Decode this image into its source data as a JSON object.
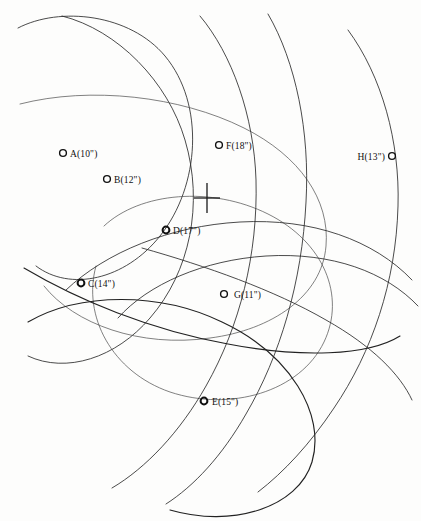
{
  "diagram": {
    "background_color": "#fdfdfc",
    "ink_color": "#2b2b2b",
    "canvas": {
      "width": 421,
      "height": 521
    },
    "crosshair": {
      "name": "center-crosshair",
      "x": 207,
      "y": 198,
      "arm_horizontal": 13,
      "arm_vertical": 15
    },
    "points": [
      {
        "id": "A",
        "label": "A(10\")",
        "radius_text": "10\"",
        "marker_x": 63,
        "marker_y": 153,
        "label_x": 70,
        "label_y": 157,
        "marker_style": "open",
        "label_side": "right"
      },
      {
        "id": "B",
        "label": "B(12\")",
        "radius_text": "12\"",
        "marker_x": 107,
        "marker_y": 179,
        "label_x": 114,
        "label_y": 183,
        "marker_style": "open",
        "label_side": "right"
      },
      {
        "id": "C",
        "label": "C(14\")",
        "radius_text": "14\"",
        "marker_x": 81,
        "marker_y": 283,
        "label_x": 88,
        "label_y": 287,
        "marker_style": "bold",
        "label_side": "right"
      },
      {
        "id": "D",
        "label": "D(17\")",
        "radius_text": "17\"",
        "marker_x": 166,
        "marker_y": 230,
        "label_x": 173,
        "label_y": 234,
        "marker_style": "bold",
        "label_side": "right"
      },
      {
        "id": "E",
        "label": "E(15\")",
        "radius_text": "15\"",
        "marker_x": 204,
        "marker_y": 401,
        "label_x": 212,
        "label_y": 405,
        "marker_style": "bold",
        "label_side": "right"
      },
      {
        "id": "F",
        "label": "F(18\")",
        "radius_text": "18\"",
        "marker_x": 219,
        "marker_y": 145,
        "label_x": 226,
        "label_y": 149,
        "marker_style": "open",
        "label_side": "right"
      },
      {
        "id": "G",
        "label": "G(11\")",
        "radius_text": "11\"",
        "marker_x": 224,
        "marker_y": 294,
        "label_x": 234,
        "label_y": 298,
        "marker_style": "open",
        "label_side": "right"
      },
      {
        "id": "H",
        "label": "H(13\")",
        "radius_text": "13\"",
        "marker_x": 392,
        "marker_y": 156,
        "label_x": 385,
        "label_y": 160,
        "marker_style": "open",
        "label_side": "left"
      }
    ],
    "arcs": [
      {
        "name": "arc-circle-1",
        "d": "M 18 28 C 60 6 130 14 165 56 C 205 104 200 186 160 236 C 125 280 70 292 36 266",
        "weight": "normal"
      },
      {
        "name": "arc-circle-2",
        "d": "M 62 16 C 118 30 168 82 185 140 C 204 204 190 272 150 318 C 116 358 66 374 28 356",
        "weight": "normal"
      },
      {
        "name": "arc-circle-3",
        "d": "M 20 104 C 90 86 180 96 244 128 C 300 156 330 200 326 246 C 322 296 272 330 210 338 C 140 348 74 324 44 286",
        "weight": "faint"
      },
      {
        "name": "arc-circle-4",
        "d": "M 104 226 C 140 192 212 186 268 214 C 324 242 346 296 324 342 C 300 392 230 412 170 392 C 112 372 82 316 96 266",
        "weight": "faint"
      },
      {
        "name": "arc-circle-5",
        "d": "M 28 322 C 80 292 160 292 222 322 C 290 354 326 414 312 462 C 298 508 232 528 170 510",
        "weight": "heavy"
      },
      {
        "name": "arc-circle-6",
        "d": "M 200 16 C 232 54 254 116 256 180 C 258 254 240 326 206 386 C 180 432 146 468 112 488",
        "weight": "normal"
      },
      {
        "name": "arc-circle-7",
        "d": "M 268 14 C 296 62 310 132 306 202 C 302 282 280 356 246 414 C 222 456 194 486 166 504",
        "weight": "normal"
      },
      {
        "name": "arc-circle-8",
        "d": "M 348 30 C 382 76 400 142 398 206 C 396 282 372 352 334 408 C 310 444 284 472 258 492",
        "weight": "normal"
      },
      {
        "name": "arc-circle-9",
        "d": "M 24 268 C 78 300 150 330 228 344 C 300 358 368 356 400 336",
        "weight": "heavy"
      },
      {
        "name": "arc-circle-10",
        "d": "M 142 248 C 206 266 274 290 326 320 C 372 346 400 374 412 400",
        "weight": "normal"
      },
      {
        "name": "arc-circle-11",
        "d": "M 66 290 C 106 252 170 226 240 222 C 312 218 374 240 412 280",
        "weight": "normal"
      },
      {
        "name": "arc-circle-12",
        "d": "M 118 318 C 148 284 204 260 266 256 C 332 252 386 272 418 306",
        "weight": "normal"
      }
    ]
  }
}
